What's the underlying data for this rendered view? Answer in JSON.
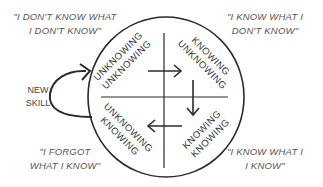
{
  "quotes": {
    "top_left": [
      "\"I DON'T KNOW WHAT",
      "I DON'T KNOW\""
    ],
    "top_right": [
      "\"I KNOW WHAT I",
      "DON'T KNOW\""
    ],
    "bottom_left": [
      "\"I FORGOT",
      "WHAT I KNOW\""
    ],
    "bottom_right": [
      "\"I KNOW WHAT I",
      "I KNOW\""
    ]
  },
  "new_skill": [
    "NEW",
    "SKILL"
  ],
  "quadrants": {
    "top_left": [
      "UNKNOWING",
      "UNKNOWING"
    ],
    "top_right": [
      "KNOWING",
      "UNKNOWING"
    ],
    "bottom_right": [
      "KNOWING",
      "KNOWING"
    ],
    "bottom_left": [
      "UNKNOWING",
      "KNOWING"
    ]
  },
  "colors": {
    "stroke": "#2b2b2b",
    "text": "#444444"
  }
}
